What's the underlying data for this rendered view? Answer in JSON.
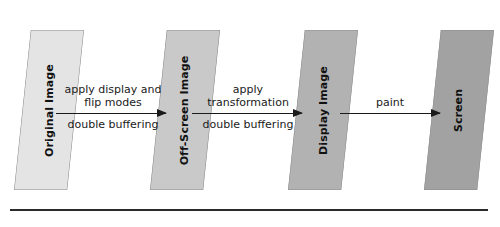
{
  "diagram": {
    "type": "flow",
    "nodes": [
      {
        "id": "original-image",
        "label": "Original Image",
        "fill": "#e4e4e4"
      },
      {
        "id": "off-screen-image",
        "label": "Off-Screen Image",
        "fill": "#c9c9c9"
      },
      {
        "id": "display-image",
        "label": "Display Image",
        "fill": "#b2b2b2"
      },
      {
        "id": "screen",
        "label": "Screen",
        "fill": "#a2a2a2"
      }
    ],
    "edges": [
      {
        "id": "edge-1",
        "from": "original-image",
        "to": "off-screen-image",
        "label_above_line_1": "apply display and",
        "label_above_line_2": "flip modes",
        "label_below": "double buffering"
      },
      {
        "id": "edge-2",
        "from": "off-screen-image",
        "to": "display-image",
        "label_above_line_1": "apply",
        "label_above_line_2": "transformation",
        "label_below": "double buffering"
      },
      {
        "id": "edge-3",
        "from": "display-image",
        "to": "screen",
        "label_above_line_1": "paint",
        "label_above_line_2": "",
        "label_below": ""
      }
    ],
    "colors": {
      "arrow": "#1a1a1a",
      "text": "#1a1a1a",
      "rule": "#2b2b2b",
      "plane_stroke": "#8d8d8d",
      "background": "#ffffff"
    }
  }
}
